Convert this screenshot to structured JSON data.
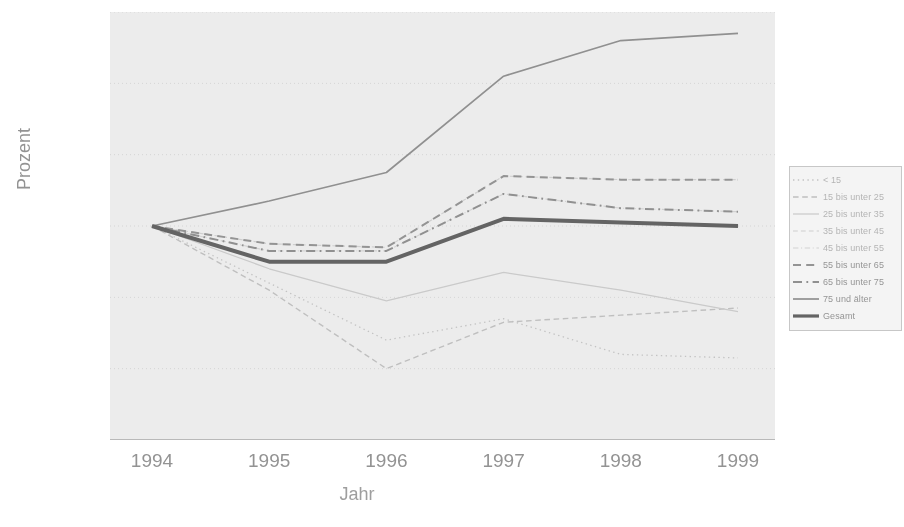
{
  "axes": {
    "ylabel": "Prozent",
    "xlabel": "Jahr",
    "yticks": [
      "160%",
      "140%",
      "120%",
      "100%",
      "80%",
      "60%",
      "40%"
    ],
    "xticks": [
      "1994",
      "1995",
      "1996",
      "1997",
      "1998",
      "1999"
    ]
  },
  "legend": {
    "items": [
      {
        "label": "< 15"
      },
      {
        "label": "15 bis unter 25"
      },
      {
        "label": "25 bis unter 35"
      },
      {
        "label": "35 bis unter 45"
      },
      {
        "label": "45 bis unter 55"
      },
      {
        "label": "55 bis unter 65"
      },
      {
        "label": "65 bis unter 75"
      },
      {
        "label": "75 und älter"
      },
      {
        "label": "Gesamt"
      }
    ]
  },
  "chart_data": {
    "type": "line",
    "title": "",
    "xlabel": "Jahr",
    "ylabel": "Prozent",
    "x": [
      "1994",
      "1995",
      "1996",
      "1997",
      "1998",
      "1999"
    ],
    "ylim": [
      40,
      160
    ],
    "ytick_step": 20,
    "grid": true,
    "legend_position": "right",
    "units": "percent (index, 1994 = 100%)",
    "series": [
      {
        "name": "< 15",
        "values": [
          100,
          84,
          68,
          74,
          64,
          63
        ],
        "style": "dotted",
        "color": "#c4c4c4",
        "width": 1.3
      },
      {
        "name": "15 bis unter 25",
        "values": [
          100,
          82,
          60,
          73,
          75,
          77
        ],
        "style": "dashed",
        "color": "#c0c0c0",
        "width": 1.4
      },
      {
        "name": "25 bis unter 35",
        "values": [
          100,
          88,
          79,
          87,
          82,
          76
        ],
        "style": "solid",
        "color": "#cccccc",
        "width": 1.2
      },
      {
        "name": "35 bis unter 45",
        "values": [
          100,
          95,
          94,
          114,
          113,
          113
        ],
        "style": "dashed",
        "color": "#d2d2d2",
        "width": 1.2
      },
      {
        "name": "45 bis unter 55",
        "values": [
          100,
          93,
          93,
          109,
          105,
          104
        ],
        "style": "dashdot",
        "color": "#d6d6d6",
        "width": 1.2
      },
      {
        "name": "55 bis unter 65",
        "values": [
          100,
          95,
          94,
          114,
          113,
          113
        ],
        "style": "dashed",
        "color": "#8e8e8e",
        "width": 2.0
      },
      {
        "name": "65 bis unter 75",
        "values": [
          100,
          93,
          93,
          109,
          105,
          104
        ],
        "style": "dashdot",
        "color": "#8a8a8a",
        "width": 2.0
      },
      {
        "name": "75 und älter",
        "values": [
          100,
          107,
          115,
          142,
          152,
          154
        ],
        "style": "solid",
        "color": "#8a8a8a",
        "width": 1.7
      },
      {
        "name": "Gesamt",
        "values": [
          100,
          90,
          90,
          102,
          101,
          100
        ],
        "style": "solid",
        "color": "#575757",
        "width": 4.0
      }
    ]
  }
}
